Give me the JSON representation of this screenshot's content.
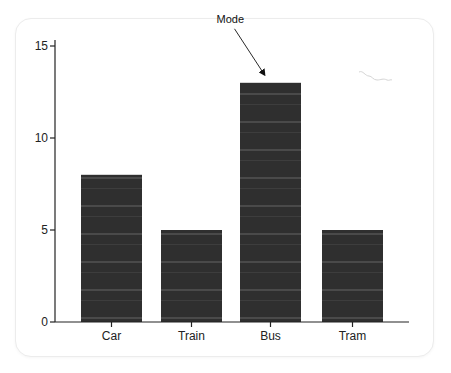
{
  "chart_data": {
    "type": "bar",
    "title": "",
    "xlabel": "",
    "ylabel": "",
    "categories": [
      "Car",
      "Train",
      "Bus",
      "Tram"
    ],
    "values": [
      8,
      5,
      13,
      5
    ],
    "ylim": [
      0,
      15
    ],
    "yticks": [
      0,
      5,
      10,
      15
    ],
    "grid": false,
    "legend": null,
    "annotations": [
      {
        "text": "Mode",
        "target_category": "Bus",
        "arrow": true
      }
    ],
    "bar_color": "#2e2e2e"
  },
  "layout": {
    "axis_left": 55,
    "axis_right": 409,
    "y0_px": 322,
    "y15_px": 46,
    "bar_width": 61,
    "bar_lefts": [
      81,
      161,
      240,
      322
    ]
  }
}
